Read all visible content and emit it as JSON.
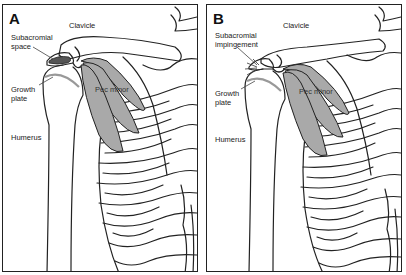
{
  "figure": {
    "panels": [
      {
        "letter": "A",
        "labels": {
          "clavicle": "Clavicle",
          "subacromial_1": "Subacromial",
          "subacromial_2": "space",
          "growth_1": "Growth",
          "growth_2": "plate",
          "pec": "Pec minor",
          "humerus": "Humerus"
        }
      },
      {
        "letter": "B",
        "labels": {
          "clavicle": "Clavicle",
          "subacromial_1": "Subacromial",
          "subacromial_2": "impingement",
          "growth_1": "Growth",
          "growth_2": "plate",
          "pec": "Pec minor",
          "humerus": "Humerus"
        }
      }
    ],
    "colors": {
      "outline": "#222222",
      "muscle": "#a9a9a9",
      "subacromial_space": "#555555",
      "growth_plate": "#999999"
    }
  }
}
